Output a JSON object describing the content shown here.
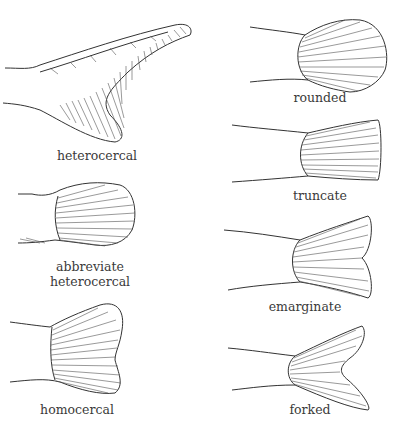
{
  "figure": {
    "colors": {
      "line": "#333333",
      "background": "#ffffff"
    },
    "panels": [
      {
        "id": "heterocercal",
        "label": "heterocercal"
      },
      {
        "id": "abbreviate-heterocercal",
        "label_line1": "abbreviate",
        "label_line2": "heterocercal"
      },
      {
        "id": "homocercal",
        "label": "homocercal"
      },
      {
        "id": "rounded",
        "label": "rounded"
      },
      {
        "id": "truncate",
        "label": "truncate"
      },
      {
        "id": "emarginate",
        "label": "emarginate"
      },
      {
        "id": "forked",
        "label": "forked"
      }
    ]
  }
}
